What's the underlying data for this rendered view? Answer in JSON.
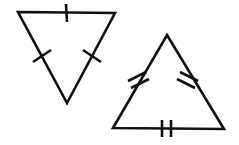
{
  "figure": {
    "background_color": "#ffffff",
    "stroke_color": "#111111",
    "stroke_width": 2.6,
    "canvas": {
      "width": 239,
      "height": 145
    },
    "shapes": [
      {
        "name": "left-triangle",
        "label": "Downward-pointing triangle",
        "orientation": "pointing-down",
        "points": "18,12 115,13 67,103",
        "vertices": [
          {
            "name": "top-left",
            "x": 18,
            "y": 12
          },
          {
            "name": "top-right",
            "x": 115,
            "y": 13
          },
          {
            "name": "bottom-apex",
            "x": 67,
            "y": 103
          }
        ],
        "sides": [
          {
            "name": "top-side",
            "tick_count": 1
          },
          {
            "name": "left-side",
            "tick_count": 1
          },
          {
            "name": "right-side",
            "tick_count": 1
          }
        ],
        "tick_marks": [
          {
            "name": "tick-top-side",
            "side": "top-side",
            "count": 1,
            "x1": 66,
            "y1": 4,
            "x2": 67,
            "y2": 22
          },
          {
            "name": "tick-left-side",
            "side": "left-side",
            "count": 1,
            "x1": 33,
            "y1": 62,
            "x2": 51,
            "y2": 50
          },
          {
            "name": "tick-right-side",
            "side": "right-side",
            "count": 1,
            "x1": 83,
            "y1": 50,
            "x2": 101,
            "y2": 62
          }
        ]
      },
      {
        "name": "right-triangle",
        "label": "Upward-pointing triangle",
        "orientation": "pointing-up",
        "points": "167,35 224,129 113,128",
        "vertices": [
          {
            "name": "top-apex",
            "x": 167,
            "y": 35
          },
          {
            "name": "bottom-right",
            "x": 224,
            "y": 129
          },
          {
            "name": "bottom-left",
            "x": 113,
            "y": 128
          }
        ],
        "sides": [
          {
            "name": "left-side",
            "tick_count": 2
          },
          {
            "name": "right-side",
            "tick_count": 2
          },
          {
            "name": "bottom-side",
            "tick_count": 2
          }
        ],
        "tick_marks": [
          {
            "name": "tick-left-side-a",
            "side": "left-side",
            "count": 2,
            "x1": 128,
            "y1": 81,
            "x2": 146,
            "y2": 72
          },
          {
            "name": "tick-left-side-b",
            "side": "left-side",
            "count": 2,
            "x1": 131,
            "y1": 88,
            "x2": 149,
            "y2": 79
          },
          {
            "name": "tick-right-side-a",
            "side": "right-side",
            "count": 2,
            "x1": 180,
            "y1": 72,
            "x2": 198,
            "y2": 81
          },
          {
            "name": "tick-right-side-b",
            "side": "right-side",
            "count": 2,
            "x1": 177,
            "y1": 79,
            "x2": 195,
            "y2": 88
          },
          {
            "name": "tick-bottom-side-a",
            "side": "bottom-side",
            "count": 2,
            "x1": 162,
            "y1": 120,
            "x2": 162,
            "y2": 137
          },
          {
            "name": "tick-bottom-side-b",
            "side": "bottom-side",
            "count": 2,
            "x1": 171,
            "y1": 120,
            "x2": 171,
            "y2": 137
          }
        ]
      }
    ]
  }
}
